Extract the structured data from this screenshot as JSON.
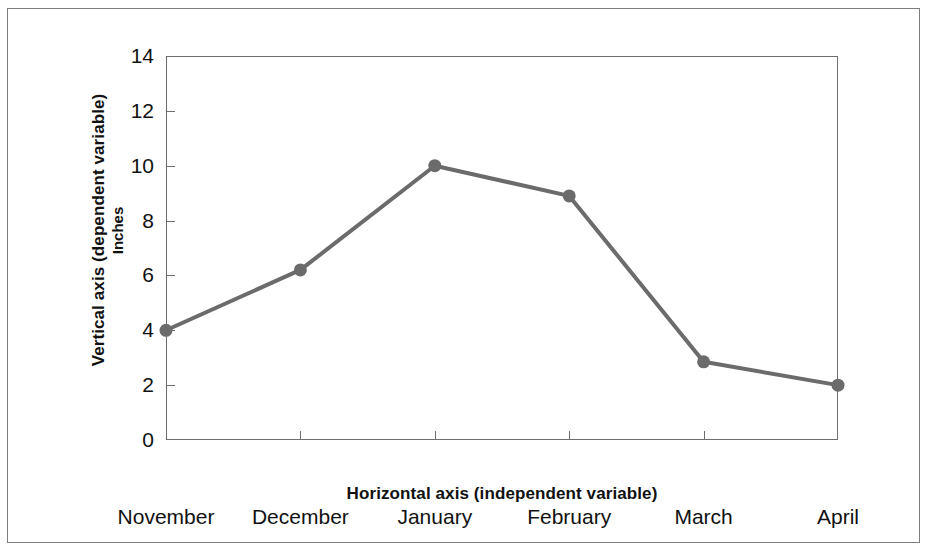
{
  "figure": {
    "background_color": "#ffffff",
    "frame_color": "#7d7d7d",
    "axis_color": "#6e6e6e",
    "series_color": "#6b6b6b"
  },
  "labels": {
    "vertical_axis_caption": "Vertical axis (dependent variable)",
    "vertical_axis_unit": "Inches",
    "horizontal_axis_caption": "Horizontal axis (independent variable)"
  },
  "chart_data": {
    "type": "line",
    "title": "",
    "xlabel": "Horizontal axis (independent variable)",
    "ylabel": "Vertical axis (dependent variable)",
    "yunit": "Inches",
    "categories": [
      "November",
      "December",
      "January",
      "February",
      "March",
      "April"
    ],
    "values": [
      4.0,
      6.2,
      10.0,
      8.9,
      2.85,
      2.0
    ],
    "series": [
      {
        "name": "Inches",
        "values": [
          4.0,
          6.2,
          10.0,
          8.9,
          2.85,
          2.0
        ],
        "color": "#6b6b6b",
        "marker": "circle",
        "marker_size": 13,
        "line_width": 4
      }
    ],
    "ylim": [
      0,
      14
    ],
    "ytick_values": [
      0,
      2,
      4,
      6,
      8,
      10,
      12,
      14
    ],
    "ytick_labels": [
      "0",
      "2",
      "4",
      "6",
      "8",
      "10",
      "12",
      "14"
    ],
    "xtick_labels": [
      "November",
      "December",
      "January",
      "February",
      "March",
      "April"
    ],
    "grid": false,
    "legend": false,
    "legend_position": "none"
  }
}
